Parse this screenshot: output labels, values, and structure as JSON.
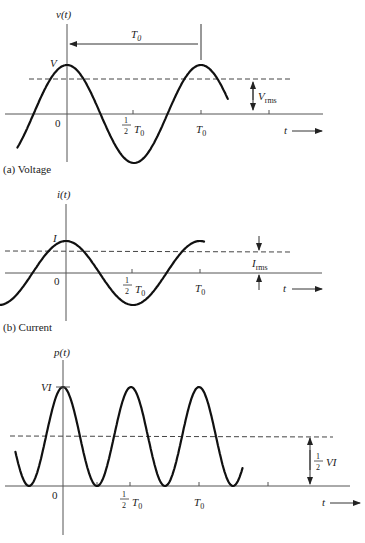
{
  "chart_data": [
    {
      "type": "line",
      "id": "voltage",
      "caption": "(a) Voltage",
      "ylabel": "v(t)",
      "xlabel": "t",
      "peak_label": "V",
      "rms_label": "V",
      "rms_sub": "rms",
      "period_label": "T",
      "period_sub": "0",
      "ticks": [
        {
          "label_main": "0",
          "label_frac": false
        },
        {
          "label_num": "1",
          "label_den": "2",
          "label_main": "T",
          "label_sub": "0",
          "label_frac": true
        },
        {
          "label_main": "T",
          "label_sub": "0",
          "label_frac": false
        }
      ],
      "function": "cosine",
      "amplitude_rel": 1.0,
      "rms_rel": 0.707,
      "x_range_periods": [
        -0.37,
        1.2
      ],
      "annotations": [
        "T0 period arrow from peak to peak",
        "Vrms double arrow from baseline to dashed line"
      ]
    },
    {
      "type": "line",
      "id": "current",
      "caption": "(b) Current",
      "ylabel": "i(t)",
      "xlabel": "t",
      "peak_label": "I",
      "rms_label": "I",
      "rms_sub": "rms",
      "ticks": [
        {
          "label_main": "0",
          "label_frac": false
        },
        {
          "label_num": "1",
          "label_den": "2",
          "label_main": "T",
          "label_sub": "0",
          "label_frac": true
        },
        {
          "label_main": "T",
          "label_sub": "0",
          "label_frac": false
        }
      ],
      "function": "cosine",
      "amplitude_rel": 1.0,
      "rms_rel": 0.707,
      "x_range_periods": [
        -0.62,
        1.03
      ],
      "annotations": [
        "Irms indicated by inward-pointing arrows"
      ]
    },
    {
      "type": "line",
      "id": "power",
      "caption": "(c) Power",
      "ylabel": "p(t)",
      "xlabel": "t",
      "peak_label": "VI",
      "avg_label_num": "1",
      "avg_label_den": "2",
      "avg_label_main": "VI",
      "ticks": [
        {
          "label_main": "0",
          "label_frac": false
        },
        {
          "label_num": "1",
          "label_den": "2",
          "label_main": "T",
          "label_sub": "0",
          "label_frac": true
        },
        {
          "label_main": "T",
          "label_sub": "0",
          "label_frac": false
        }
      ],
      "function": "cosine squared",
      "peak_rel": 1.0,
      "average_rel": 0.5,
      "x_range_periods": [
        -0.35,
        1.32
      ],
      "annotations": [
        "1/2 VI average value arrow from baseline to dashed line"
      ]
    }
  ],
  "arrow_glyph": "→"
}
